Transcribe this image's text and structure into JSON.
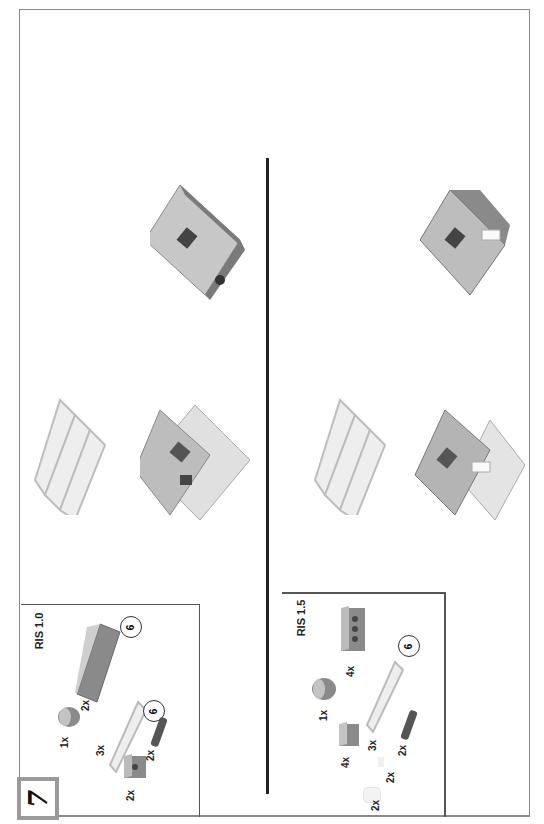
{
  "page": {
    "orientation": "rotated -90deg",
    "step_number": "7"
  },
  "ris_1_0": {
    "title": "RIS 1.0",
    "parts": [
      {
        "name": "brick-2x6-dark-gray",
        "qty": "2x",
        "multiplier": "6"
      },
      {
        "name": "round-brick-2x2-dark-gray",
        "qty": "1x"
      },
      {
        "name": "plate-1x6-light-gray",
        "qty": "3x",
        "multiplier": "6"
      },
      {
        "name": "technic-pin-dark",
        "qty": "2x"
      },
      {
        "name": "technic-brick-1x2-dark-gray",
        "qty": "2x"
      }
    ]
  },
  "ris_1_5": {
    "title": "RIS 1.5",
    "parts": [
      {
        "name": "technic-brick-1x4-dark-gray",
        "qty": "4x"
      },
      {
        "name": "round-brick-2x2-dark-gray",
        "qty": "1x"
      },
      {
        "name": "brick-2x2-dark-gray",
        "qty": "4x"
      },
      {
        "name": "plate-1x6-light-gray",
        "qty": "3x",
        "multiplier": "6"
      },
      {
        "name": "technic-pin-dark",
        "qty": "2x"
      },
      {
        "name": "small-white-part",
        "qty": "2x"
      },
      {
        "name": "white-round-part",
        "qty": "2x"
      }
    ]
  },
  "colors": {
    "dark_gray": "#7a7a7a",
    "light_gray": "#d8d8d8",
    "border": "#8a8a8a",
    "divider": "#222222"
  }
}
